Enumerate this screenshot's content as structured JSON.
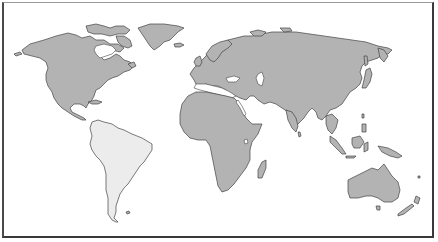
{
  "map": {
    "type": "world-outline",
    "projection": "equirectangular-like",
    "colors": {
      "background": "#ffffff",
      "land": "#b3b3b3",
      "highlight": "#ececec",
      "outline": "#444444",
      "frame": "#3a3a3a"
    },
    "regions": [
      {
        "name": "North America",
        "highlighted": false
      },
      {
        "name": "Greenland",
        "highlighted": false
      },
      {
        "name": "South America",
        "highlighted": true
      },
      {
        "name": "Europe",
        "highlighted": false
      },
      {
        "name": "Africa",
        "highlighted": false
      },
      {
        "name": "Asia",
        "highlighted": false
      },
      {
        "name": "Madagascar",
        "highlighted": false
      },
      {
        "name": "Southeast Asia Islands",
        "highlighted": false
      },
      {
        "name": "Australia",
        "highlighted": false
      },
      {
        "name": "New Zealand",
        "highlighted": false
      }
    ],
    "highlighted_region": "South America"
  }
}
